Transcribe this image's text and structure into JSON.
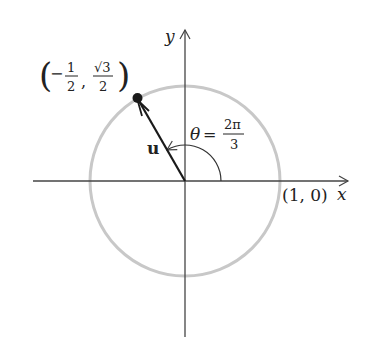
{
  "figure": {
    "type": "unit-circle",
    "axes": {
      "x_label": "x",
      "y_label": "y"
    },
    "point": {
      "label_open": "(",
      "x_sign": "−",
      "x_num": "1",
      "x_den": "2",
      "comma": ",",
      "y_num": "√3",
      "y_den": "2",
      "label_close": ")"
    },
    "vector_label": "u",
    "angle": {
      "symbol": "θ",
      "equals": "=",
      "num": "2π",
      "den": "3"
    },
    "x_intercept_label": "(1, 0)",
    "colors": {
      "circle": "#c8c8c8",
      "axes": "#444444",
      "vector": "#1a1a1a"
    }
  }
}
